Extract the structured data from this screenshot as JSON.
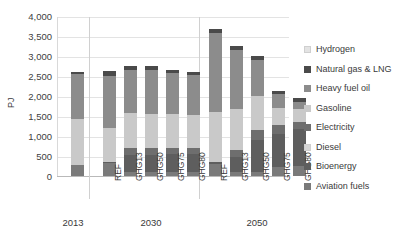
{
  "chart_data": {
    "type": "bar",
    "subtype": "stacked-bar",
    "title": "",
    "xlabel": "",
    "ylabel": "PJ",
    "ylim": [
      0,
      4000
    ],
    "yticks": [
      "0",
      "500",
      "1,000",
      "1,500",
      "2,000",
      "2,500",
      "3,000",
      "3,500",
      "4,000"
    ],
    "ytick_values": [
      0,
      500,
      1000,
      1500,
      2000,
      2500,
      3000,
      3500,
      4000
    ],
    "grid": true,
    "legend_position": "right",
    "groups": [
      {
        "label": "2013",
        "scenarios": [
          ""
        ]
      },
      {
        "label": "2030",
        "scenarios": [
          "REF",
          "GHG13",
          "GHG50",
          "GHG75",
          "GHG80"
        ]
      },
      {
        "label": "2050",
        "scenarios": [
          "REF",
          "GHG13",
          "GHG50",
          "GHG75",
          "GHG80"
        ]
      }
    ],
    "categories": [
      "2013",
      "2030 REF",
      "2030 GHG13",
      "2030 GHG50",
      "2030 GHG75",
      "2030 GHG80",
      "2050 REF",
      "2050 GHG13",
      "2050 GHG50",
      "2050 GHG75",
      "2050 GHG80"
    ],
    "stack_order_bottom_to_top": [
      "Aviation fuels",
      "Bioenergy",
      "Diesel",
      "Electricity",
      "Gasoline",
      "Heavy fuel oil",
      "Natural gas & LNG",
      "Hydrogen"
    ],
    "series": [
      {
        "name": "Hydrogen",
        "color": "#e3e3e3",
        "values": [
          0,
          0,
          0,
          0,
          0,
          0,
          0,
          0,
          0,
          0,
          0
        ]
      },
      {
        "name": "Natural gas & LNG",
        "color": "#4a4a4a",
        "values": [
          60,
          110,
          90,
          90,
          90,
          90,
          110,
          120,
          110,
          95,
          110
        ]
      },
      {
        "name": "Heavy fuel oil",
        "color": "#8c8c8c",
        "values": [
          1120,
          1310,
          1080,
          1090,
          1020,
          990,
          1960,
          1470,
          900,
          330,
          170
        ]
      },
      {
        "name": "Gasoline",
        "color": "#c9c9c9",
        "values": [
          1140,
          840,
          880,
          870,
          840,
          820,
          1260,
          1020,
          840,
          430,
          320
        ]
      },
      {
        "name": "Electricity",
        "color": "#6e6e6e",
        "values": [
          0,
          0,
          170,
          170,
          160,
          160,
          0,
          180,
          260,
          230,
          190
        ]
      },
      {
        "name": "Diesel",
        "color": "#d6d6d6",
        "values": [
          0,
          0,
          0,
          0,
          0,
          0,
          0,
          0,
          0,
          0,
          0
        ]
      },
      {
        "name": "Bioenergy",
        "color": "#5e5e5e",
        "values": [
          0,
          40,
          420,
          420,
          450,
          450,
          40,
          370,
          800,
          820,
          930
        ]
      },
      {
        "name": "Aviation fuels",
        "color": "#7a7a7a",
        "values": [
          280,
          320,
          100,
          100,
          100,
          100,
          310,
          100,
          100,
          230,
          240
        ]
      }
    ],
    "totals": [
      2600,
      2620,
      2740,
      2740,
      2660,
      2610,
      3680,
      3260,
      3010,
      2135,
      1960
    ]
  },
  "legend": {
    "items": [
      {
        "label": "Hydrogen",
        "color": "#e3e3e3"
      },
      {
        "label": "Natural gas & LNG",
        "color": "#4a4a4a"
      },
      {
        "label": "Heavy fuel oil",
        "color": "#8c8c8c"
      },
      {
        "label": "Gasoline",
        "color": "#c9c9c9"
      },
      {
        "label": "Electricity",
        "color": "#6e6e6e"
      },
      {
        "label": "Diesel",
        "color": "#d6d6d6"
      },
      {
        "label": "Bioenergy",
        "color": "#5e5e5e"
      },
      {
        "label": "Aviation fuels",
        "color": "#7a7a7a"
      }
    ]
  },
  "colors": {
    "gridline": "#e3e3e3",
    "axis": "#b9b9b9",
    "text": "#3a3a3a",
    "background": "#ffffff"
  }
}
